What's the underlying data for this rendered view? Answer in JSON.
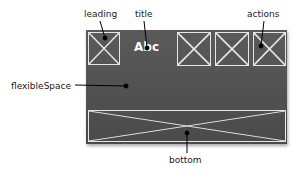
{
  "diagram": {
    "title_text": "Abc",
    "labels": {
      "leading": "leading",
      "title": "title",
      "actions": "actions",
      "flexible_space": "flexibleSpace",
      "bottom": "bottom"
    },
    "colors": {
      "appbar": "#525252",
      "placeholder_stroke": "#e6e6e6",
      "title": "#ffffff",
      "callout": "#000000"
    },
    "action_count": 3
  }
}
